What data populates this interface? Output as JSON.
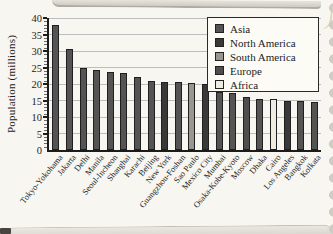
{
  "chart_data": {
    "type": "bar",
    "title": "",
    "ylabel": "Population (millions)",
    "xlabel": "",
    "ylim": [
      0,
      40
    ],
    "ytick_step": 5,
    "yticks": [
      "0",
      "5",
      "10",
      "15",
      "20",
      "25",
      "30",
      "35",
      "40"
    ],
    "grid": true,
    "legend_position": "top-right",
    "categories": [
      "Tokyo-Yokohama",
      "Jakarta",
      "Delhi",
      "Manila",
      "Seoul-Incheon",
      "Shanghai",
      "Karachi",
      "Beijing",
      "New York",
      "Guangzhou-Foshan",
      "Sao Paulo",
      "Mexico City",
      "Mumbai",
      "Osaka-Kobe-Kyoto",
      "Moscow",
      "Dhaka",
      "Cairo",
      "Los Angeles",
      "Bangkok",
      "Kolkata"
    ],
    "values": [
      37.8,
      30.5,
      25.0,
      24.1,
      23.5,
      23.4,
      22.1,
      21.0,
      20.6,
      20.6,
      20.4,
      20.0,
      17.7,
      17.4,
      16.1,
      15.6,
      15.6,
      15.0,
      14.9,
      14.6
    ],
    "bar_groups": [
      "Asia",
      "Asia",
      "Asia",
      "Asia",
      "Asia",
      "Asia",
      "Asia",
      "Asia",
      "North America",
      "Asia",
      "South America",
      "North America",
      "Asia",
      "Asia",
      "Europe",
      "Asia",
      "Africa",
      "North America",
      "Asia",
      "Asia"
    ],
    "legend": [
      {
        "label": "Asia",
        "color": "#545454"
      },
      {
        "label": "North America",
        "color": "#393939"
      },
      {
        "label": "South America",
        "color": "#98968f"
      },
      {
        "label": "Europe",
        "color": "#4e4e4e"
      },
      {
        "label": "Africa",
        "color": "#eeece1"
      }
    ],
    "colors": {
      "axis": "#1c1c1c",
      "grid": "#bdbdbd",
      "bar_border": "#1f1f1f",
      "legend_bg": "#fcfbf6",
      "page_bg": "#f8f6f0"
    }
  }
}
